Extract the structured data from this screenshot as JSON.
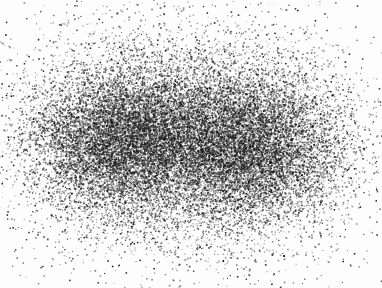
{
  "figure": {
    "title": "",
    "subtitle": "",
    "caption": "",
    "width_px": 382,
    "height_px": 288,
    "background_color": "#fdfdfd",
    "point_color": "#1a1a1a",
    "has_axes": false,
    "has_frame": false,
    "has_legend": false,
    "has_gridlines": false,
    "has_tick_labels": false
  },
  "artifacts": [
    {
      "name": "scan-speck-left",
      "x": 266,
      "y": 1,
      "w": 11,
      "h": 6
    },
    {
      "name": "scan-speck-right",
      "x": 314,
      "y": 1,
      "w": 10,
      "h": 5
    }
  ],
  "chart_data": {
    "type": "scatter",
    "title": "",
    "xlabel": "",
    "ylabel": "",
    "xlim": [
      0,
      382
    ],
    "ylim": [
      0,
      288
    ],
    "grid": false,
    "legend": false,
    "legend_position": "none",
    "point_color": "#1a1a1a",
    "point_size_px": 1.15,
    "point_opacity": 0.55,
    "total_points": 26000,
    "description": "Dense bimodal two-dimensional point cloud with two overlapping elliptical Gaussian clusters of near-equal weight, plus a broad low-density halo and scattered outliers. No axes, ticks, gridlines, labels or legend are rendered.",
    "series": [
      {
        "name": "cluster-left",
        "distribution": "gaussian2d",
        "n": 9400,
        "center_x": 124,
        "center_y": 139,
        "sigma_x": 46,
        "sigma_y": 36,
        "rotation_deg": -6
      },
      {
        "name": "cluster-right",
        "distribution": "gaussian2d",
        "n": 9400,
        "center_x": 246,
        "center_y": 146,
        "sigma_x": 48,
        "sigma_y": 37,
        "rotation_deg": 4
      },
      {
        "name": "halo",
        "distribution": "gaussian2d",
        "n": 6000,
        "center_x": 186,
        "center_y": 141,
        "sigma_x": 82,
        "sigma_y": 58,
        "rotation_deg": 0
      },
      {
        "name": "outliers",
        "distribution": "gaussian2d",
        "n": 1200,
        "center_x": 186,
        "center_y": 141,
        "sigma_x": 118,
        "sigma_y": 80,
        "rotation_deg": 0
      }
    ],
    "cloud_bounds": {
      "x_min": 18,
      "x_max": 358,
      "y_min": 12,
      "y_max": 268
    },
    "density_peaks": [
      {
        "label": "left-peak",
        "x": 124,
        "y": 139,
        "relative_density": 1.0
      },
      {
        "label": "right-peak",
        "x": 246,
        "y": 146,
        "relative_density": 0.97
      },
      {
        "label": "saddle",
        "x": 186,
        "y": 142,
        "relative_density": 0.74
      }
    ]
  }
}
